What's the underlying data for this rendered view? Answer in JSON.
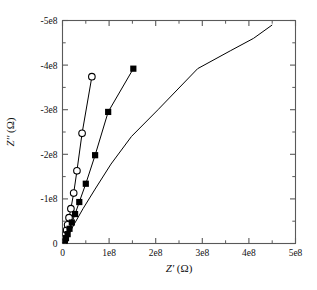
{
  "chart_data": {
    "type": "scatter",
    "title": "",
    "xlabel": "Z' (Ω)",
    "ylabel": "Z'' (Ω)",
    "xlim": [
      0,
      500000000
    ],
    "ylim": [
      0,
      -500000000
    ],
    "grid": false,
    "legend": "none",
    "xticks": [
      0,
      100000000,
      200000000,
      300000000,
      400000000,
      500000000
    ],
    "xticklabels": [
      "0",
      "1e8",
      "2e8",
      "3e8",
      "4e8",
      "5e8"
    ],
    "yticks": [
      0,
      -100000000,
      -200000000,
      -300000000,
      -400000000,
      -500000000
    ],
    "yticklabels": [
      "0",
      "-1e8",
      "-2e8",
      "-3e8",
      "-4e8",
      "-5e8"
    ],
    "minor_ticks": true,
    "series": [
      {
        "name": "open-circles",
        "marker": "circle-open",
        "color": "#000000",
        "line": true,
        "x": [
          2000000,
          3000000,
          4000000,
          5500000,
          7000000,
          9000000,
          11000000,
          14000000,
          18000000,
          24000000,
          31000000,
          42000000,
          63000000
        ],
        "y": [
          -1500000,
          -4000000,
          -8000000,
          -14000000,
          -21000000,
          -30000000,
          -42000000,
          -58000000,
          -78000000,
          -113000000,
          -163000000,
          -247000000,
          -374000000
        ]
      },
      {
        "name": "filled-squares",
        "marker": "square-filled",
        "color": "#000000",
        "line": true,
        "x": [
          3000000,
          5000000,
          7500000,
          11000000,
          15000000,
          20000000,
          27000000,
          36000000,
          50000000,
          70000000,
          98000000,
          152000000
        ],
        "y": [
          -2000000,
          -6000000,
          -12000000,
          -21000000,
          -33000000,
          -47000000,
          -66000000,
          -93000000,
          -134000000,
          -198000000,
          -295000000,
          -392000000
        ]
      },
      {
        "name": "line-only",
        "marker": "none",
        "color": "#000000",
        "line": true,
        "x": [
          1000000,
          6000000,
          14000000,
          26000000,
          44000000,
          70000000,
          104000000,
          148000000,
          205000000,
          290000000,
          360000000,
          410000000,
          450000000
        ],
        "y": [
          0,
          -8000000,
          -22000000,
          -45000000,
          -78000000,
          -122000000,
          -178000000,
          -240000000,
          -300000000,
          -392000000,
          -432000000,
          -460000000,
          -490000000
        ]
      }
    ]
  }
}
